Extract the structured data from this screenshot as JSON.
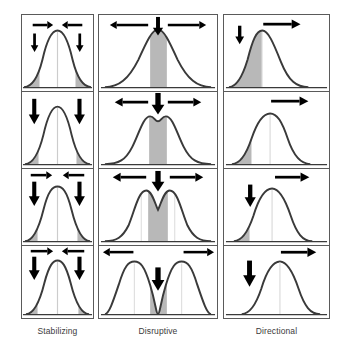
{
  "figure": {
    "rows": 4,
    "columns": 3,
    "panel_border_color": "#5a5a5a",
    "curve_color": "#3a3a3a",
    "shade_color": "#b8b8b8",
    "mean_line_color": "#cccccc",
    "arrow_color": "#000000",
    "background": "#ffffff"
  },
  "columns": [
    {
      "id": "stabilizing",
      "label": "Stabilizing",
      "panels": [
        {
          "row": 1,
          "curve": "unimodal",
          "shaded": "both-tails",
          "arrows": [
            "right-small-left",
            "left-small-right",
            "down-left",
            "down-right"
          ]
        },
        {
          "row": 2,
          "curve": "unimodal-narrower",
          "shaded": "both-tails",
          "arrows": [
            "down-left-large",
            "down-right-large"
          ]
        },
        {
          "row": 3,
          "curve": "unimodal-narrower",
          "shaded": "both-tails",
          "arrows": [
            "right-small-left",
            "left-small-right",
            "down-left-large",
            "down-right-large"
          ]
        },
        {
          "row": 4,
          "curve": "unimodal-narrowest",
          "shaded": "both-tails",
          "arrows": [
            "right-small-left",
            "left-small-right",
            "down-left-large",
            "down-right-large"
          ]
        }
      ]
    },
    {
      "id": "disruptive",
      "label": "Disruptive",
      "panels": [
        {
          "row": 1,
          "curve": "unimodal",
          "shaded": "center",
          "arrows": [
            "left-long",
            "down-center",
            "right-long"
          ]
        },
        {
          "row": 2,
          "curve": "bimodal-shallow",
          "shaded": "center",
          "arrows": [
            "left-long",
            "down-center-large",
            "right-long"
          ]
        },
        {
          "row": 3,
          "curve": "bimodal-medium",
          "shaded": "center",
          "arrows": [
            "left-long",
            "down-center-large",
            "right-long"
          ]
        },
        {
          "row": 4,
          "curve": "bimodal-full",
          "shaded": "center",
          "arrows": [
            "left-long",
            "down-center-large",
            "right-long"
          ]
        }
      ]
    },
    {
      "id": "directional",
      "label": "Directional",
      "panels": [
        {
          "row": 1,
          "curve": "unimodal",
          "shaded": "left-of-mean",
          "arrows": [
            "down-left",
            "right-long"
          ]
        },
        {
          "row": 2,
          "curve": "unimodal",
          "shaded": "left-tail",
          "arrows": [
            "right-long"
          ]
        },
        {
          "row": 3,
          "curve": "unimodal",
          "shaded": "left-tail-small",
          "arrows": [
            "down-left",
            "right-long"
          ]
        },
        {
          "row": 4,
          "curve": "unimodal-shifted-right",
          "shaded": "none",
          "arrows": [
            "down-left-large",
            "right-long"
          ]
        }
      ]
    }
  ]
}
